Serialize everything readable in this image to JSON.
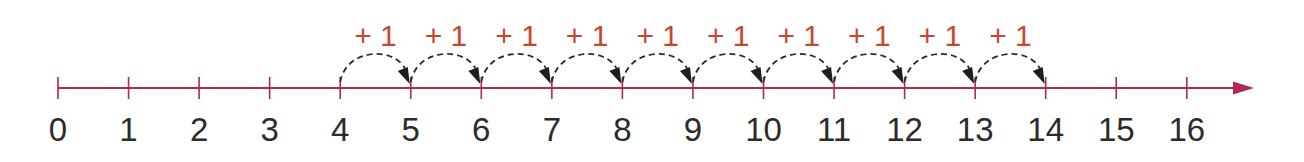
{
  "number_line": {
    "start": 0,
    "end": 16,
    "tick_labels": [
      "0",
      "1",
      "2",
      "3",
      "4",
      "5",
      "6",
      "7",
      "8",
      "9",
      "10",
      "11",
      "12",
      "13",
      "14",
      "15",
      "16"
    ],
    "axis_color": "#b0294f",
    "arrow": "right"
  },
  "jumps": {
    "from": 4,
    "to": 14,
    "count": 10,
    "label": "+ 1",
    "labels": [
      "+ 1",
      "+ 1",
      "+ 1",
      "+ 1",
      "+ 1",
      "+ 1",
      "+ 1",
      "+ 1",
      "+ 1",
      "+ 1"
    ],
    "label_color": "#c8462c",
    "arc_style": "dashed",
    "arc_color": "#2b2b2b"
  }
}
